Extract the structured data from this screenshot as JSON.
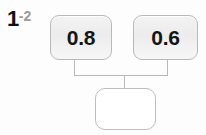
{
  "label": {
    "major": "1",
    "minor": "-2"
  },
  "colors": {
    "node_border": "#b9b9b9",
    "node_fill": "#f0f0f0",
    "empty_fill": "#ffffff",
    "wire": "#b9b9b9",
    "text": "#151515",
    "label_major": "#111111",
    "label_minor": "#9a9a9a",
    "background": "#fdfdfd"
  },
  "diagram": {
    "type": "tree",
    "orientation": "top-down",
    "parents": [
      {
        "id": "left",
        "value": "0.8",
        "filled": true
      },
      {
        "id": "right",
        "value": "0.6",
        "filled": true
      }
    ],
    "child": {
      "id": "output",
      "value": "",
      "filled": false
    }
  }
}
